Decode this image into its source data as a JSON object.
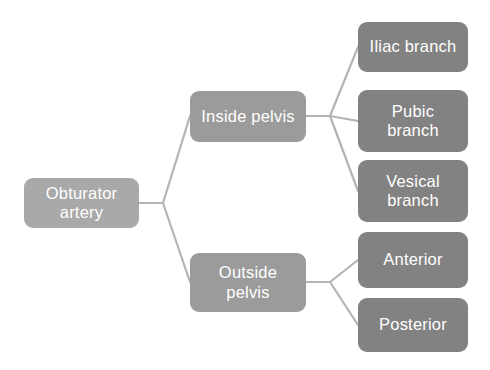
{
  "diagram": {
    "canvas": {
      "width": 490,
      "height": 370,
      "background": "#ffffff"
    },
    "palette": {
      "root_fill": "#a9a9a9",
      "mid_fill": "#9b9b9b",
      "leaf_fill": "#828282",
      "connector": "#b4b4b4",
      "text": "#ffffff"
    },
    "root": {
      "label": "Obturator\nartery",
      "level": "root",
      "x": 24,
      "y": 178,
      "w": 115,
      "h": 50
    },
    "branches": [
      {
        "label": "Inside pelvis",
        "level": "mid",
        "x": 190,
        "y": 91,
        "w": 116,
        "h": 51,
        "children": [
          {
            "label": "Iliac branch",
            "level": "leaf",
            "x": 358,
            "y": 22,
            "w": 110,
            "h": 50
          },
          {
            "label": "Pubic\nbranch",
            "level": "leaf",
            "x": 358,
            "y": 90,
            "w": 110,
            "h": 62
          },
          {
            "label": "Vesical\nbranch",
            "level": "leaf",
            "x": 358,
            "y": 160,
            "w": 110,
            "h": 62
          }
        ]
      },
      {
        "label": "Outside\npelvis",
        "level": "mid",
        "x": 190,
        "y": 253,
        "w": 116,
        "h": 59,
        "children": [
          {
            "label": "Anterior",
            "level": "leaf",
            "x": 358,
            "y": 232,
            "w": 110,
            "h": 56
          },
          {
            "label": "Posterior",
            "level": "leaf",
            "x": 358,
            "y": 298,
            "w": 110,
            "h": 54
          }
        ]
      }
    ],
    "connectors": [
      {
        "name": "root-to-inside-pelvis",
        "points": "139,203 163,203 190,116"
      },
      {
        "name": "root-to-outside-pelvis",
        "points": "139,203 163,203 190,282"
      },
      {
        "name": "inside-pelvis-to-iliac-branch",
        "points": "306,116 330,116 358,47"
      },
      {
        "name": "inside-pelvis-to-pubic-branch",
        "points": "306,116 330,116 358,121"
      },
      {
        "name": "inside-pelvis-to-vesical-branch",
        "points": "306,116 330,116 358,191"
      },
      {
        "name": "outside-pelvis-to-anterior",
        "points": "306,282 330,282 358,260"
      },
      {
        "name": "outside-pelvis-to-posterior",
        "points": "306,282 330,282 358,325"
      }
    ]
  }
}
